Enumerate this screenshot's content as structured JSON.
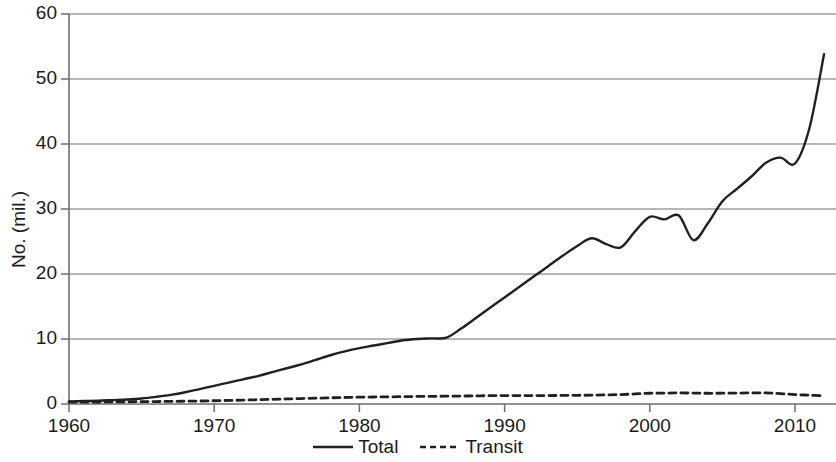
{
  "chart_data": {
    "type": "line",
    "title": "",
    "xlabel": "",
    "ylabel": "No. (mil.)",
    "xlim": [
      1960,
      1973
    ],
    "ylim": [
      0,
      60
    ],
    "x_ticks": [
      1960,
      1970,
      1980,
      1990,
      2000,
      2010
    ],
    "y_ticks": [
      0,
      10,
      20,
      30,
      40,
      50,
      60
    ],
    "grid": "horizontal",
    "legend_position": "bottom-center",
    "x": [
      1960,
      1961,
      1962,
      1963,
      1964,
      1965,
      1966,
      1967,
      1968,
      1969,
      1970,
      1971,
      1972,
      1973,
      1974,
      1975,
      1976,
      1977,
      1978,
      1979,
      1980,
      1981,
      1982,
      1983,
      1984,
      1985,
      1986,
      1987,
      1988,
      1989,
      1990,
      1991,
      1992,
      1993,
      1994,
      1995,
      1996,
      1997,
      1998,
      1999,
      2000,
      2001,
      2002,
      2003,
      2004,
      2005,
      2006,
      2007,
      2008,
      2009,
      2010,
      2011,
      2012
    ],
    "series": [
      {
        "name": "Total",
        "style": "solid",
        "color": "#231f20",
        "values": [
          0.4,
          0.45,
          0.5,
          0.6,
          0.7,
          0.85,
          1.1,
          1.4,
          1.8,
          2.3,
          2.8,
          3.3,
          3.8,
          4.3,
          4.9,
          5.5,
          6.1,
          6.8,
          7.5,
          8.1,
          8.6,
          9.0,
          9.4,
          9.8,
          10.0,
          10.1,
          10.2,
          11.6,
          13.2,
          14.8,
          16.4,
          18.0,
          19.6,
          21.2,
          22.8,
          24.3,
          25.5,
          24.6,
          24.1,
          26.6,
          28.8,
          28.4,
          29.0,
          25.2,
          27.8,
          31.2,
          33.1,
          35.0,
          37.1,
          37.9,
          37.0,
          42.5,
          53.8
        ]
      },
      {
        "name": "Transit",
        "style": "dashed",
        "color": "#231f20",
        "values": [
          0.3,
          0.3,
          0.3,
          0.32,
          0.34,
          0.36,
          0.38,
          0.4,
          0.43,
          0.46,
          0.5,
          0.55,
          0.6,
          0.66,
          0.72,
          0.78,
          0.84,
          0.9,
          0.95,
          1.0,
          1.05,
          1.08,
          1.1,
          1.13,
          1.16,
          1.18,
          1.2,
          1.22,
          1.25,
          1.28,
          1.3,
          1.3,
          1.3,
          1.3,
          1.32,
          1.34,
          1.36,
          1.4,
          1.45,
          1.55,
          1.65,
          1.68,
          1.7,
          1.68,
          1.65,
          1.66,
          1.68,
          1.7,
          1.7,
          1.6,
          1.45,
          1.35,
          1.25
        ]
      }
    ],
    "legend": [
      {
        "label": "Total",
        "style": "solid"
      },
      {
        "label": "Transit",
        "style": "dashed"
      }
    ],
    "axis_color": "#6d6e71",
    "gridline_color": "#6d6e71"
  }
}
